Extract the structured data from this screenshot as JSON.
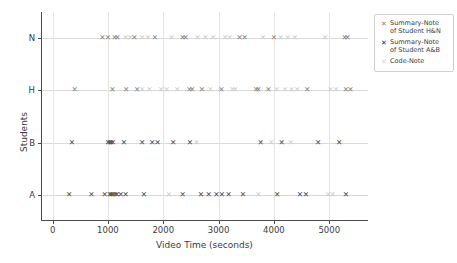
{
  "chart_data": {
    "type": "scatter",
    "title": "",
    "xlabel": "Video Time (seconds)",
    "ylabel": "Students",
    "xlim": [
      -210,
      5700
    ],
    "xticks": [
      0,
      1000,
      2000,
      3000,
      4000,
      5000
    ],
    "xtick_labels": [
      "0",
      "1000",
      "2000",
      "3000",
      "4000",
      "5000"
    ],
    "ycategories": [
      "A",
      "B",
      "H",
      "N"
    ],
    "ytick_labels": [
      "N",
      "H",
      "B",
      "A"
    ],
    "grid": "both-light",
    "legend_position": "upper right",
    "series": [
      {
        "name": "Summary-Note of Student H&N",
        "marker": "x",
        "color": "#7f7f7f",
        "points": [
          {
            "x": 900,
            "y": "N"
          },
          {
            "x": 1000,
            "y": "N"
          },
          {
            "x": 1120,
            "y": "N"
          },
          {
            "x": 1170,
            "y": "N"
          },
          {
            "x": 1480,
            "y": "N"
          },
          {
            "x": 1850,
            "y": "N"
          },
          {
            "x": 2350,
            "y": "N"
          },
          {
            "x": 2400,
            "y": "N"
          },
          {
            "x": 3380,
            "y": "N"
          },
          {
            "x": 3470,
            "y": "N"
          },
          {
            "x": 4000,
            "y": "N"
          },
          {
            "x": 5280,
            "y": "N"
          },
          {
            "x": 5330,
            "y": "N"
          },
          {
            "x": 400,
            "y": "H"
          },
          {
            "x": 1080,
            "y": "H"
          },
          {
            "x": 1330,
            "y": "H"
          },
          {
            "x": 1530,
            "y": "H"
          },
          {
            "x": 2470,
            "y": "H"
          },
          {
            "x": 2520,
            "y": "H"
          },
          {
            "x": 2700,
            "y": "H"
          },
          {
            "x": 3050,
            "y": "H"
          },
          {
            "x": 3680,
            "y": "H"
          },
          {
            "x": 3720,
            "y": "H"
          },
          {
            "x": 3900,
            "y": "H"
          },
          {
            "x": 4600,
            "y": "H"
          },
          {
            "x": 5300,
            "y": "H"
          },
          {
            "x": 5380,
            "y": "H"
          }
        ]
      },
      {
        "name": "Summary-Note of Student A&B",
        "marker": "X",
        "color": "#444444",
        "points": [
          {
            "x": 350,
            "y": "B"
          },
          {
            "x": 1000,
            "y": "B"
          },
          {
            "x": 1030,
            "y": "B"
          },
          {
            "x": 1060,
            "y": "B"
          },
          {
            "x": 1090,
            "y": "B"
          },
          {
            "x": 1290,
            "y": "B"
          },
          {
            "x": 1620,
            "y": "B"
          },
          {
            "x": 1800,
            "y": "B"
          },
          {
            "x": 1900,
            "y": "B"
          },
          {
            "x": 2180,
            "y": "B"
          },
          {
            "x": 2480,
            "y": "B"
          },
          {
            "x": 3760,
            "y": "B"
          },
          {
            "x": 4140,
            "y": "B"
          },
          {
            "x": 4800,
            "y": "B"
          },
          {
            "x": 5180,
            "y": "B"
          },
          {
            "x": 300,
            "y": "A"
          },
          {
            "x": 700,
            "y": "A"
          },
          {
            "x": 940,
            "y": "A"
          },
          {
            "x": 1030,
            "y": "A"
          },
          {
            "x": 1060,
            "y": "A"
          },
          {
            "x": 1090,
            "y": "A"
          },
          {
            "x": 1130,
            "y": "A"
          },
          {
            "x": 1160,
            "y": "A"
          },
          {
            "x": 1230,
            "y": "A"
          },
          {
            "x": 1320,
            "y": "A"
          },
          {
            "x": 1650,
            "y": "A"
          },
          {
            "x": 2350,
            "y": "A"
          },
          {
            "x": 2680,
            "y": "A"
          },
          {
            "x": 2820,
            "y": "A"
          },
          {
            "x": 2960,
            "y": "A"
          },
          {
            "x": 3060,
            "y": "A"
          },
          {
            "x": 3180,
            "y": "A"
          },
          {
            "x": 3440,
            "y": "A"
          },
          {
            "x": 4060,
            "y": "A"
          },
          {
            "x": 4470,
            "y": "A"
          },
          {
            "x": 4580,
            "y": "A"
          },
          {
            "x": 5300,
            "y": "A"
          }
        ]
      },
      {
        "name": "Code-Note",
        "marker": "x",
        "color": "#cccccc",
        "points": [
          {
            "x": 1320,
            "y": "N"
          },
          {
            "x": 1400,
            "y": "N"
          },
          {
            "x": 1620,
            "y": "N"
          },
          {
            "x": 1720,
            "y": "N"
          },
          {
            "x": 2150,
            "y": "N"
          },
          {
            "x": 2620,
            "y": "N"
          },
          {
            "x": 2760,
            "y": "N"
          },
          {
            "x": 2900,
            "y": "N"
          },
          {
            "x": 3120,
            "y": "N"
          },
          {
            "x": 3200,
            "y": "N"
          },
          {
            "x": 3800,
            "y": "N"
          },
          {
            "x": 4120,
            "y": "N"
          },
          {
            "x": 4250,
            "y": "N"
          },
          {
            "x": 4380,
            "y": "N"
          },
          {
            "x": 4920,
            "y": "N"
          },
          {
            "x": 1620,
            "y": "H"
          },
          {
            "x": 1750,
            "y": "H"
          },
          {
            "x": 1960,
            "y": "H"
          },
          {
            "x": 2060,
            "y": "H"
          },
          {
            "x": 2250,
            "y": "H"
          },
          {
            "x": 2850,
            "y": "H"
          },
          {
            "x": 3250,
            "y": "H"
          },
          {
            "x": 3300,
            "y": "H"
          },
          {
            "x": 4050,
            "y": "H"
          },
          {
            "x": 4200,
            "y": "H"
          },
          {
            "x": 4320,
            "y": "H"
          },
          {
            "x": 4420,
            "y": "H"
          },
          {
            "x": 5020,
            "y": "H"
          },
          {
            "x": 5120,
            "y": "H"
          },
          {
            "x": 2600,
            "y": "B"
          },
          {
            "x": 3950,
            "y": "B"
          },
          {
            "x": 4300,
            "y": "B"
          },
          {
            "x": 2100,
            "y": "A"
          },
          {
            "x": 3720,
            "y": "A"
          },
          {
            "x": 4980,
            "y": "A"
          },
          {
            "x": 5060,
            "y": "A"
          }
        ]
      }
    ]
  },
  "legend": {
    "entries": [
      {
        "marker": "✕",
        "line1": "Summary-Note",
        "line2": "of Student H&N",
        "style": "s-hn"
      },
      {
        "marker": "✕",
        "line1": "Summary-Note",
        "line2": "of Student A&B",
        "style": "s-ab"
      },
      {
        "marker": "✕",
        "line1": "Code-Note",
        "line2": "",
        "style": "s-code"
      }
    ]
  }
}
